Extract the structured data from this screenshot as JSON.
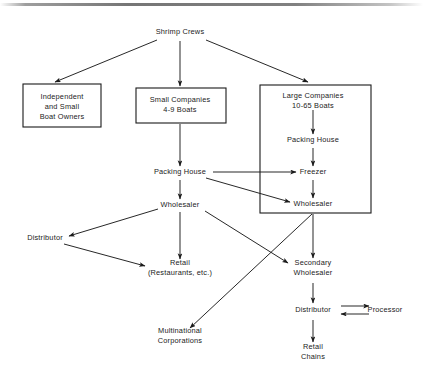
{
  "diagram": {
    "background_color": "#ffffff",
    "line_color": "#1b1b1b",
    "text_color": "#1b1b1b",
    "nodes": [
      {
        "id": "shrimp_crews",
        "label": "Shrimp Crews",
        "lines": [
          "Shrimp Crews"
        ],
        "x": 180,
        "y": 32,
        "boxed": false
      },
      {
        "id": "independent_small_boat_owners",
        "label": "Independent and Small Boat Owners",
        "lines": [
          "Independent",
          "and Small",
          "Boat Owners"
        ],
        "x": 62,
        "y": 107,
        "boxed": true
      },
      {
        "id": "small_companies",
        "label": "Small Companies 4-9 Boats",
        "lines": [
          "Small Companies",
          "4-9 Boats"
        ],
        "x": 180,
        "y": 105,
        "boxed": true
      },
      {
        "id": "large_companies",
        "label": "Large Companies 10-65 Boats",
        "lines": [
          "Large Companies",
          "10-65 Boats"
        ],
        "x": 313,
        "y": 101,
        "boxed": false
      },
      {
        "id": "large_packing_house",
        "label": "Packing House",
        "lines": [
          "Packing House"
        ],
        "x": 313,
        "y": 140,
        "boxed": false
      },
      {
        "id": "freezer",
        "label": "Freezer",
        "lines": [
          "Freezer"
        ],
        "x": 313,
        "y": 172,
        "boxed": false
      },
      {
        "id": "large_wholesaler",
        "label": "Wholesaler",
        "lines": [
          "Wholesaler"
        ],
        "x": 313,
        "y": 204,
        "boxed": false
      },
      {
        "id": "packing_house",
        "label": "Packing House",
        "lines": [
          "Packing House"
        ],
        "x": 180,
        "y": 172,
        "boxed": false
      },
      {
        "id": "wholesaler",
        "label": "Wholesaler",
        "lines": [
          "Wholesaler"
        ],
        "x": 180,
        "y": 205,
        "boxed": false
      },
      {
        "id": "distributor",
        "label": "Distributor",
        "lines": [
          "Distributor"
        ],
        "x": 45,
        "y": 238,
        "boxed": false
      },
      {
        "id": "retail",
        "label": "Retail (Restaurants, etc.)",
        "lines": [
          "Retail",
          "(Restaurants, etc.)"
        ],
        "x": 180,
        "y": 268,
        "boxed": false
      },
      {
        "id": "secondary_wholesaler",
        "label": "Secondary Wholesaler",
        "lines": [
          "Secondary",
          "Wholesaler"
        ],
        "x": 313,
        "y": 268,
        "boxed": false
      },
      {
        "id": "multinational_corporations",
        "label": "Multinational Corporations",
        "lines": [
          "Multinational",
          "Corporations"
        ],
        "x": 180,
        "y": 336,
        "boxed": false
      },
      {
        "id": "bottom_distributor",
        "label": "Distributor",
        "lines": [
          "Distributor"
        ],
        "x": 313,
        "y": 310,
        "boxed": false
      },
      {
        "id": "processor",
        "label": "Processor",
        "lines": [
          "Processor"
        ],
        "x": 385,
        "y": 310,
        "boxed": false
      },
      {
        "id": "retail_chains",
        "label": "Retail Chains",
        "lines": [
          "Retail",
          "Chains"
        ],
        "x": 313,
        "y": 352,
        "boxed": false
      }
    ],
    "boxes": [
      {
        "id": "box-independent",
        "name": "box-independent-small-boat-owners",
        "x": 23,
        "y": 84,
        "width": 78,
        "height": 43
      },
      {
        "id": "box-small-companies",
        "name": "box-small-companies",
        "x": 136,
        "y": 88,
        "width": 90,
        "height": 35
      },
      {
        "id": "box-large-companies",
        "name": "box-large-companies",
        "x": 260,
        "y": 85,
        "width": 111,
        "height": 128
      }
    ],
    "edges": [
      {
        "id": "edge-crews-to-independent",
        "from": "shrimp_crews",
        "to": "independent_small_boat_owners",
        "path": "M 157 40 L 55 82",
        "arrow": true
      },
      {
        "id": "edge-crews-to-small",
        "from": "shrimp_crews",
        "to": "small_companies",
        "path": "M 180 41 L 180 86",
        "arrow": true
      },
      {
        "id": "edge-crews-to-large",
        "from": "shrimp_crews",
        "to": "large_companies",
        "path": "M 206 40 L 308 82",
        "arrow": true
      },
      {
        "id": "edge-small-to-packing",
        "from": "small_companies",
        "to": "packing_house",
        "path": "M 180 124 L 180 166",
        "arrow": true
      },
      {
        "id": "edge-large-to-packing",
        "from": "large_companies",
        "to": "large_packing_house",
        "path": "M 313 110 L 313 134",
        "arrow": true
      },
      {
        "id": "edge-packing-to-freezer-large",
        "from": "large_packing_house",
        "to": "freezer",
        "path": "M 313 148 L 313 166",
        "arrow": true
      },
      {
        "id": "edge-freezer-to-wholesaler",
        "from": "freezer",
        "to": "large_wholesaler",
        "path": "M 313 180 L 313 198",
        "arrow": true
      },
      {
        "id": "edge-packing-to-freezer",
        "from": "packing_house",
        "to": "freezer",
        "path": "M 213 172 L 296 172",
        "arrow": true
      },
      {
        "id": "edge-packing-to-large-wholesaler",
        "from": "packing_house",
        "to": "large_wholesaler",
        "path": "M 206 178 L 290 202",
        "arrow": true
      },
      {
        "id": "edge-packing-to-wholesaler",
        "from": "packing_house",
        "to": "wholesaler",
        "path": "M 180 180 L 180 199",
        "arrow": true
      },
      {
        "id": "edge-wholesaler-to-distributor",
        "from": "wholesaler",
        "to": "distributor",
        "path": "M 158 209 L 69 236",
        "arrow": true
      },
      {
        "id": "edge-wholesaler-to-retail",
        "from": "wholesaler",
        "to": "retail",
        "path": "M 180 212 L 180 259",
        "arrow": true
      },
      {
        "id": "edge-wholesaler-to-secondary",
        "from": "wholesaler",
        "to": "secondary_wholesaler",
        "path": "M 205 211 L 288 263",
        "arrow": true
      },
      {
        "id": "edge-distributor-to-retail",
        "from": "distributor",
        "to": "retail",
        "path": "M 64 244 L 145 266",
        "arrow": true
      },
      {
        "id": "edge-largebox-to-secondary",
        "from": "large_companies",
        "to": "secondary_wholesaler",
        "path": "M 313 214 L 313 258",
        "arrow": true
      },
      {
        "id": "edge-largebox-to-multinational",
        "from": "large_companies",
        "to": "multinational_corporations",
        "path": "M 312 214 L 190 328",
        "arrow": true
      },
      {
        "id": "edge-secondary-to-distributor",
        "from": "secondary_wholesaler",
        "to": "bottom_distributor",
        "path": "M 313 283 L 313 303",
        "arrow": true
      },
      {
        "id": "edge-distributor-to-processor",
        "from": "bottom_distributor",
        "to": "processor",
        "path": "M 341 306 L 369 306",
        "arrow": true
      },
      {
        "id": "edge-processor-to-distributor",
        "from": "processor",
        "to": "bottom_distributor",
        "path": "M 369 314 L 341 314",
        "arrow": true
      },
      {
        "id": "edge-distributor-to-retail-chains",
        "from": "bottom_distributor",
        "to": "retail_chains",
        "path": "M 313 320 L 313 342",
        "arrow": true
      }
    ]
  }
}
